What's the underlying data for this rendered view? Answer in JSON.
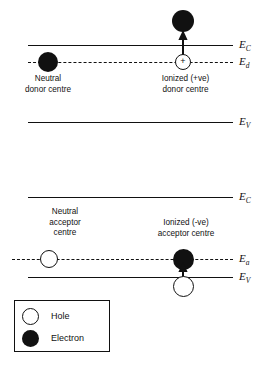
{
  "diagram": {
    "upper_section": {
      "name": "donor-diagram",
      "levels": [
        {
          "id": "ec-upper",
          "label": "E",
          "subscript": "C",
          "style": "solid"
        },
        {
          "id": "ed-upper",
          "label": "E",
          "subscript": "d",
          "style": "dashed"
        },
        {
          "id": "ev-upper",
          "label": "E",
          "subscript": "V",
          "style": "solid"
        }
      ],
      "neutral_caption": {
        "line1": "Neutral",
        "line2": "donor centre"
      },
      "ionized_caption": {
        "line1": "Ionized (+ve)",
        "line2": "donor centre"
      },
      "ionized_sign": "+"
    },
    "lower_section": {
      "name": "acceptor-diagram",
      "levels": [
        {
          "id": "ec-lower",
          "label": "E",
          "subscript": "C",
          "style": "solid"
        },
        {
          "id": "ea-lower",
          "label": "E",
          "subscript": "a",
          "style": "dashed"
        },
        {
          "id": "ev-lower",
          "label": "E",
          "subscript": "V",
          "style": "solid"
        }
      ],
      "neutral_caption": {
        "line1": "Neutral",
        "line2": "acceptor",
        "line3": "centre"
      },
      "ionized_caption": {
        "line1": "Ionized (-ve)",
        "line2": "acceptor centre"
      },
      "neutral_sign": "-"
    },
    "legend": {
      "items": [
        {
          "symbol": "open-circle",
          "label": "Hole"
        },
        {
          "symbol": "filled-circle",
          "label": "Electron"
        }
      ]
    },
    "colors": {
      "ink": "#111111",
      "paper": "#ffffff"
    }
  }
}
